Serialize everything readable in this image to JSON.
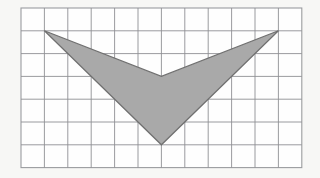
{
  "figure": {
    "name": "chevron-on-grid",
    "background_color": "#fdfdfd",
    "grid": {
      "columns": 12,
      "rows": 7,
      "cell_width": 23.4,
      "cell_height": 22.8,
      "origin_x": 21,
      "origin_y": 8,
      "line_color": "#8e9094",
      "frame_color": "#9a9c9f",
      "cell_fill": "#fefefe",
      "visible": true
    },
    "shape": {
      "type": "polygon",
      "label": "chevron",
      "fill_color": "#a9a9a9",
      "stroke_color": "#707070",
      "vertices_grid": [
        {
          "col": 1,
          "row": 1,
          "name": "left-tip"
        },
        {
          "col": 6,
          "row": 3,
          "name": "inner-notch"
        },
        {
          "col": 11,
          "row": 1,
          "name": "right-tip"
        },
        {
          "col": 6,
          "row": 6,
          "name": "bottom-point"
        }
      ],
      "vertices_px": [
        {
          "x": 44.4,
          "y": 30.8
        },
        {
          "x": 161.4,
          "y": 76.4
        },
        {
          "x": 278.4,
          "y": 30.8
        },
        {
          "x": 161.4,
          "y": 144.8
        }
      ]
    }
  },
  "chart_data": {
    "type": "scatter",
    "title": "",
    "subtitle": "",
    "xlabel": "",
    "ylabel": "",
    "xlim": [
      0,
      12
    ],
    "ylim": [
      0,
      7
    ],
    "grid": true,
    "legend": null,
    "tick_labels_x": [],
    "tick_labels_y": [],
    "annotations": [],
    "series": [
      {
        "name": "chevron-polygon",
        "type": "polygon",
        "closed": true,
        "x": [
          1,
          6,
          11,
          6
        ],
        "y": [
          6,
          4,
          6,
          1
        ],
        "fill": "#a9a9a9",
        "edge": "#707070"
      }
    ]
  }
}
